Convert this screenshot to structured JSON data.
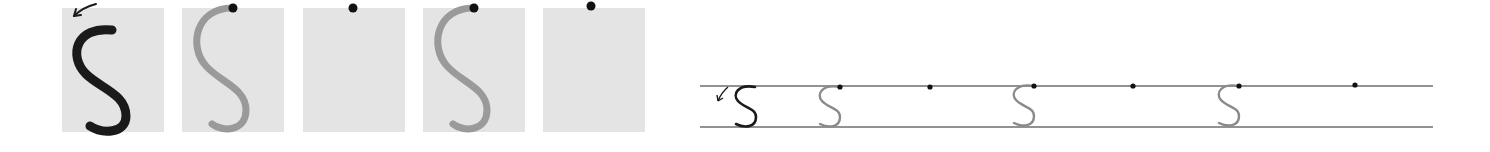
{
  "worksheet": {
    "letter": "S",
    "instruction": "Trace the letter S starting at the dot, following the arrow",
    "colors": {
      "box_bg": "#e4e4e4",
      "model_stroke": "#1a1a1a",
      "trace_stroke": "#9a9a9a",
      "start_dot": "#111111",
      "guide_line": "#6e6e6e"
    },
    "large_boxes": [
      {
        "index": 1,
        "type": "model",
        "has_arrow": true,
        "has_letter": true,
        "stroke": "dark"
      },
      {
        "index": 2,
        "type": "trace",
        "has_arrow": false,
        "has_letter": true,
        "stroke": "gray"
      },
      {
        "index": 3,
        "type": "blank",
        "has_arrow": false,
        "has_letter": false
      },
      {
        "index": 4,
        "type": "trace",
        "has_arrow": false,
        "has_letter": true,
        "stroke": "gray"
      },
      {
        "index": 5,
        "type": "blank",
        "has_arrow": false,
        "has_letter": false
      }
    ],
    "guide_row": [
      {
        "index": 1,
        "type": "model",
        "has_arrow": true
      },
      {
        "index": 2,
        "type": "trace"
      },
      {
        "index": 3,
        "type": "blank"
      },
      {
        "index": 4,
        "type": "trace"
      },
      {
        "index": 5,
        "type": "blank"
      },
      {
        "index": 6,
        "type": "trace"
      },
      {
        "index": 7,
        "type": "blank"
      }
    ]
  }
}
